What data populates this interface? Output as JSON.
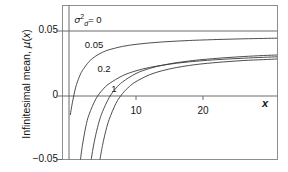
{
  "chart_data": {
    "type": "line",
    "title": "",
    "xlabel": "x",
    "ylabel": "Infinitesimal mean, μ(x)",
    "xlim": [
      -1.2,
      31.2
    ],
    "ylim": [
      -0.0555,
      0.0655
    ],
    "xticks": [
      10,
      20
    ],
    "xticklabels": [
      "10",
      "20"
    ],
    "yticks": [
      0.05,
      0,
      -0.05
    ],
    "yticklabels": [
      "0.05",
      "0",
      "−0.05"
    ],
    "grid": false,
    "legend_position": "inline-curve-labels",
    "asymptote": 0.05,
    "series": [
      {
        "name": "σ²d = 0",
        "label": "0",
        "label_full": "σ²_d = 0",
        "x": [
          0.2,
          0.5,
          1,
          1.5,
          2,
          3,
          4,
          5,
          6,
          8,
          10,
          12,
          14,
          16,
          18,
          20,
          23,
          26,
          29,
          31
        ],
        "y": [
          -0.0145,
          -0.0053,
          0.0068,
          0.0144,
          0.0198,
          0.0268,
          0.0311,
          0.034,
          0.036,
          0.0386,
          0.0402,
          0.0413,
          0.0421,
          0.0427,
          0.0432,
          0.0436,
          0.0441,
          0.0445,
          0.0448,
          0.045
        ]
      },
      {
        "name": "σ²d = 0.05",
        "label": "0.05",
        "x": [
          1.7,
          2,
          2.5,
          3,
          4,
          5,
          6,
          8,
          10,
          12,
          14,
          16,
          18,
          20,
          23,
          26,
          29,
          31
        ],
        "y": [
          -0.05,
          -0.0385,
          -0.024,
          -0.0143,
          -0.0024,
          0.0048,
          0.0096,
          0.0158,
          0.0196,
          0.0222,
          0.024,
          0.0255,
          0.0266,
          0.0275,
          0.0286,
          0.0294,
          0.0301,
          0.0305
        ]
      },
      {
        "name": "σ²d = 0.2",
        "label": "0.2",
        "x": [
          3.3,
          3.6,
          4,
          4.5,
          5,
          6,
          7,
          8,
          10,
          12,
          14,
          16,
          18,
          20,
          23,
          26,
          29,
          31
        ],
        "y": [
          -0.05,
          -0.0404,
          -0.03,
          -0.0198,
          -0.0122,
          -0.0012,
          0.006,
          0.011,
          0.0175,
          0.0214,
          0.024,
          0.0259,
          0.0273,
          0.0284,
          0.0297,
          0.0307,
          0.0315,
          0.0319
        ]
      },
      {
        "name": "σ²d = 1",
        "label": "1",
        "x": [
          4.6,
          5,
          5.5,
          6,
          7,
          8,
          9,
          10,
          12,
          14,
          16,
          18,
          20,
          23,
          26,
          29,
          31
        ],
        "y": [
          -0.05,
          -0.0385,
          -0.027,
          -0.0182,
          -0.0058,
          0.002,
          0.0073,
          0.0112,
          0.0165,
          0.0198,
          0.0221,
          0.0238,
          0.0251,
          0.0265,
          0.0276,
          0.0283,
          0.0288
        ]
      }
    ],
    "curve_labels": [
      {
        "text": "0",
        "prefix": "σ²_d =",
        "x_px": 88,
        "y_px": 20
      },
      {
        "text": "0.05",
        "x_px": 94,
        "y_px": 44
      },
      {
        "text": "0.2",
        "x_px": 104,
        "y_px": 68
      },
      {
        "text": "1",
        "x_px": 114,
        "y_px": 88
      }
    ],
    "colors": {
      "curve": "#3a3a3a",
      "axis": "#555555",
      "frame": "#8a8a8a",
      "text": "#141414",
      "background": "#ffffff"
    }
  },
  "axes": {
    "y_title_prefix": "Infinitesimal mean, ",
    "y_title_mu": "μ",
    "y_title_paren_open": "(",
    "y_title_var": "x",
    "y_title_paren_close": ")",
    "x_title": "x",
    "ytick_top": "0.05",
    "ytick_mid": "0",
    "ytick_bottom": "−0.05",
    "xtick_10": "10",
    "xtick_20": "20"
  },
  "labels": {
    "sigma": "σ",
    "sup2": "2",
    "subd": "d",
    "eq0": "= 0",
    "c005": "0.05",
    "c02": "0.2",
    "c1": "1"
  }
}
